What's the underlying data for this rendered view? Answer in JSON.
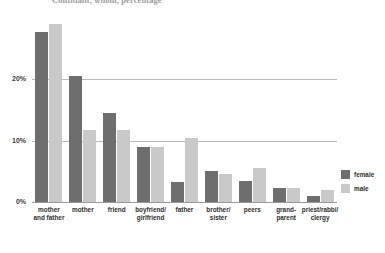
{
  "chart_data": {
    "type": "bar",
    "title": "Confidant, whom, percentage",
    "xlabel": "",
    "ylabel": "",
    "ylim": [
      0,
      31
    ],
    "grid": true,
    "legend_position": "right",
    "ytick_labels": [
      "20%",
      "10%",
      "0%"
    ],
    "ytick_values": [
      20,
      10,
      0
    ],
    "categories": [
      "mother and father",
      "mother",
      "friend",
      "boyfriend/ girlfriend",
      "father",
      "brother/ sister",
      "peers",
      "grand- parent",
      "priest/rabbi/ clergy"
    ],
    "category_lines": [
      [
        "mother",
        "and father"
      ],
      [
        "mother",
        ""
      ],
      [
        "friend",
        ""
      ],
      [
        "boyfriend/",
        "girlfriend"
      ],
      [
        "father",
        ""
      ],
      [
        "brother/",
        "sister"
      ],
      [
        "peers",
        ""
      ],
      [
        "grand-",
        "parent"
      ],
      [
        "priest/rabbi/",
        "clergy"
      ]
    ],
    "series": [
      {
        "name": "female",
        "color": "#6e6e6e",
        "values": [
          27.8,
          20.5,
          14.6,
          9.0,
          3.2,
          5.0,
          3.5,
          2.3,
          1.0
        ]
      },
      {
        "name": "male",
        "color": "#c9c9c9",
        "values": [
          29.0,
          11.8,
          11.7,
          9.0,
          10.5,
          4.5,
          5.5,
          2.3,
          2.0
        ]
      }
    ]
  },
  "legend": {
    "items": [
      {
        "label": "female",
        "color": "#6e6e6e"
      },
      {
        "label": "male",
        "color": "#c9c9c9"
      }
    ]
  },
  "colors": {
    "female": "#6e6e6e",
    "male": "#c9c9c9",
    "grid": "#b9b9b9",
    "axis": "#9a9a9a",
    "text": "#2e2e2e",
    "background": "#ffffff"
  }
}
